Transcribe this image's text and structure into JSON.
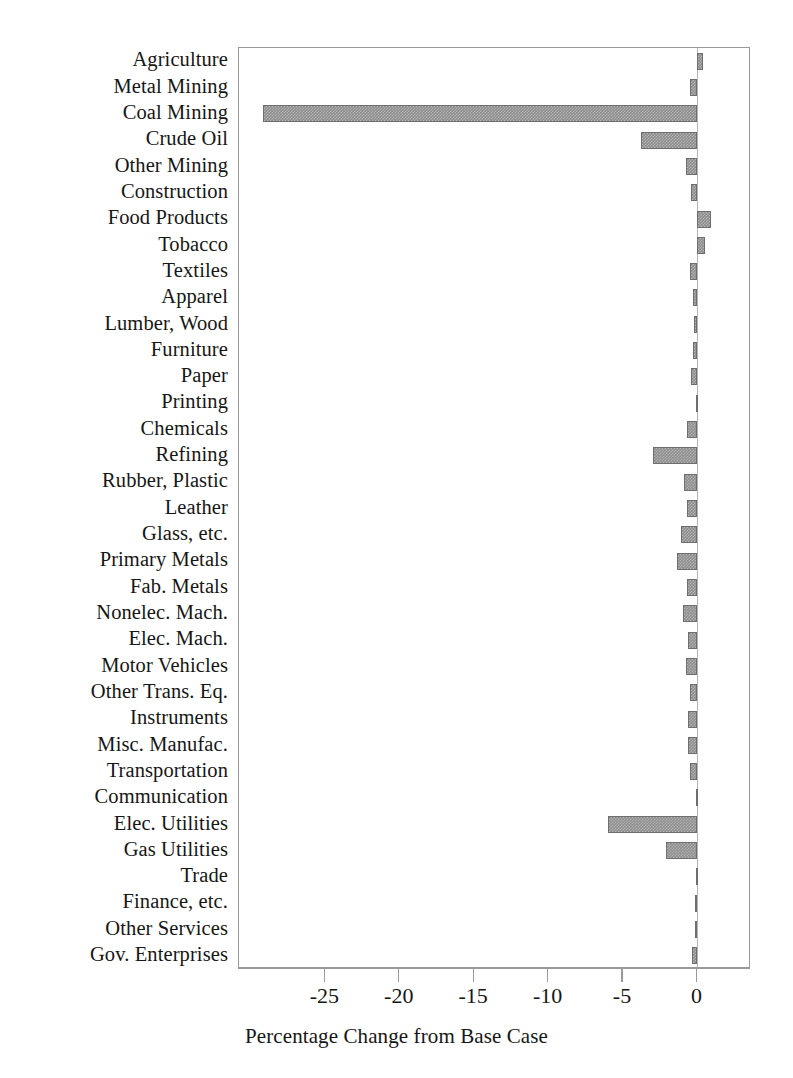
{
  "chart_data": {
    "type": "bar",
    "orientation": "horizontal",
    "title": "",
    "xlabel": "Percentage Change from Base Case",
    "ylabel": "",
    "xlim": [
      -30.8,
      3.6
    ],
    "xticks": [
      -25,
      -20,
      -15,
      -10,
      -5,
      0
    ],
    "xtick_labels": [
      "-25",
      "-20",
      "-15",
      "-10",
      "-5",
      "0"
    ],
    "grid": false,
    "legend": null,
    "bar_color": "#8d8d8d",
    "bar_edge_color": "#6e6e6e",
    "frame_color": "#9a9a9a",
    "categories": [
      "Agriculture",
      "Metal Mining",
      "Coal Mining",
      "Crude Oil",
      "Other Mining",
      "Construction",
      "Food Products",
      "Tobacco",
      "Textiles",
      "Apparel",
      "Lumber, Wood",
      "Furniture",
      "Paper",
      "Printing",
      "Chemicals",
      "Refining",
      "Rubber, Plastic",
      "Leather",
      "Glass, etc.",
      "Primary Metals",
      "Fab. Metals",
      "Nonelec. Mach.",
      "Elec. Mach.",
      "Motor Vehicles",
      "Other Trans. Eq.",
      "Instruments",
      "Misc. Manufac.",
      "Transportation",
      "Communication",
      "Elec. Utilities",
      "Gas Utilities",
      "Trade",
      "Finance, etc.",
      "Other Services",
      "Gov. Enterprises"
    ],
    "values": [
      0.4,
      -0.5,
      -29.2,
      -3.8,
      -0.8,
      -0.4,
      0.9,
      0.5,
      -0.5,
      -0.3,
      -0.2,
      -0.3,
      -0.4,
      -0.1,
      -0.7,
      -3.0,
      -0.9,
      -0.7,
      -1.1,
      -1.4,
      -0.7,
      -1.0,
      -0.6,
      -0.8,
      -0.5,
      -0.6,
      -0.6,
      -0.5,
      -0.1,
      -6.0,
      -2.1,
      -0.1,
      -0.15,
      -0.15,
      -0.35
    ]
  }
}
